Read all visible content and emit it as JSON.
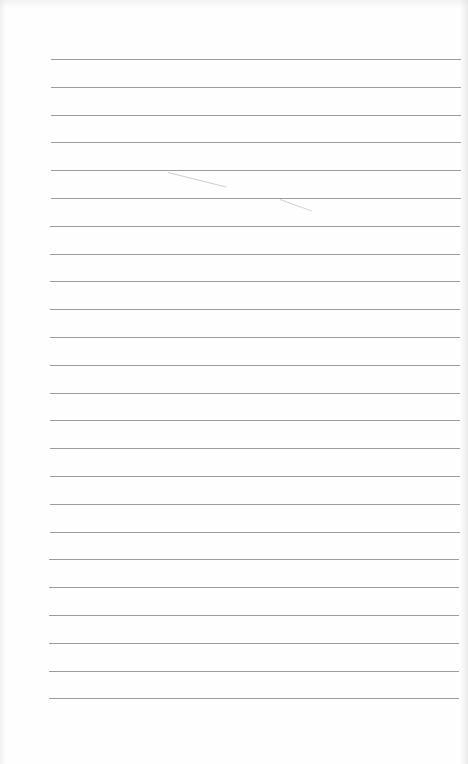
{
  "document": {
    "type": "blank-ruled-notebook-page",
    "background_color": "#fefefe",
    "rules": {
      "count": 24,
      "first_y": 59,
      "spacing": 27.8,
      "left_x": 51,
      "right_x": 461,
      "color": "#9c9c9c",
      "thickness": 1
    },
    "marks": [
      {
        "x": 168,
        "y": 172,
        "length": 60,
        "angle": 14
      },
      {
        "x": 280,
        "y": 199,
        "length": 34,
        "angle": 20
      }
    ]
  }
}
